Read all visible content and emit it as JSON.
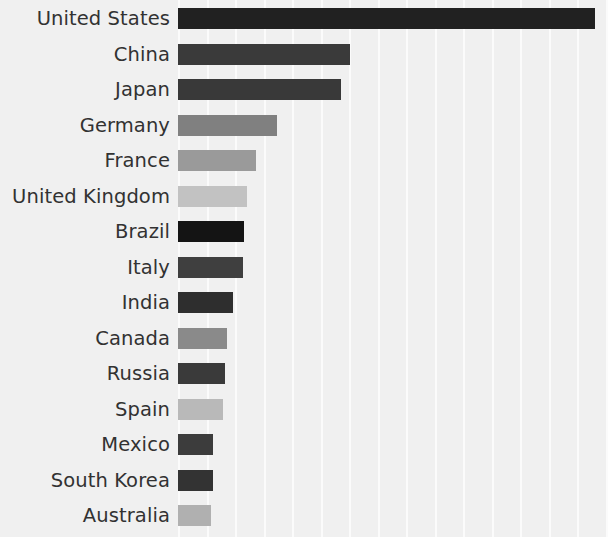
{
  "chart_data": {
    "type": "bar",
    "orientation": "horizontal",
    "title": "",
    "subtitle": "",
    "xlabel": "",
    "ylabel": "",
    "grid": "vertical-only",
    "legend": "none",
    "xlim": [
      0,
      440
    ],
    "axis_ticks_visible": false,
    "background_color": "#f0f0f0",
    "gridline_color": "#fbfbfb",
    "label_color": "#323232",
    "categories": [
      "United States",
      "China",
      "Japan",
      "Germany",
      "France",
      "United Kingdom",
      "Brazil",
      "Italy",
      "India",
      "Canada",
      "Russia",
      "Spain",
      "Mexico",
      "South Korea",
      "Australia"
    ],
    "values": [
      417,
      172,
      163,
      99,
      78,
      69,
      66,
      65,
      55,
      49,
      47,
      45,
      35,
      35,
      33
    ],
    "bar_colors": [
      "#212121",
      "#3a3a3a",
      "#393939",
      "#808080",
      "#9a9a9a",
      "#c2c2c2",
      "#141414",
      "#3f3f3f",
      "#2e2e2e",
      "#8a8a8a",
      "#3a3a3a",
      "#b9b9b9",
      "#3c3c3c",
      "#333333",
      "#b0b0b0"
    ],
    "bars": [
      {
        "label": "United States",
        "value": 417,
        "color": "#212121"
      },
      {
        "label": "China",
        "value": 172,
        "color": "#3a3a3a"
      },
      {
        "label": "Japan",
        "value": 163,
        "color": "#393939"
      },
      {
        "label": "Germany",
        "value": 99,
        "color": "#808080"
      },
      {
        "label": "France",
        "value": 78,
        "color": "#9a9a9a"
      },
      {
        "label": "United Kingdom",
        "value": 69,
        "color": "#c2c2c2"
      },
      {
        "label": "Brazil",
        "value": 66,
        "color": "#141414"
      },
      {
        "label": "Italy",
        "value": 65,
        "color": "#3f3f3f"
      },
      {
        "label": "India",
        "value": 55,
        "color": "#2e2e2e"
      },
      {
        "label": "Canada",
        "value": 49,
        "color": "#8a8a8a"
      },
      {
        "label": "Russia",
        "value": 47,
        "color": "#3a3a3a"
      },
      {
        "label": "Spain",
        "value": 45,
        "color": "#b9b9b9"
      },
      {
        "label": "Mexico",
        "value": 35,
        "color": "#3c3c3c"
      },
      {
        "label": "South Korea",
        "value": 35,
        "color": "#333333"
      },
      {
        "label": "Australia",
        "value": 33,
        "color": "#b0b0b0"
      }
    ]
  },
  "layout": {
    "plot_left": 178,
    "row_pitch": 35.5,
    "first_row_top": 8,
    "bar_height": 21,
    "gridline_spacing": 28.5,
    "gridline_count": 16
  }
}
